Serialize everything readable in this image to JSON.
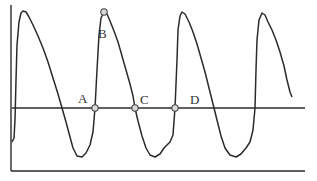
{
  "diagram": {
    "type": "waveform",
    "colors": {
      "stroke": "#2b2b2b",
      "point_fill": "#d8d8d8",
      "point_stroke": "#444444",
      "label": "#333333",
      "background": "#ffffff"
    },
    "axes": {
      "vertical": {
        "x": 11,
        "y1": 5,
        "y2": 171
      },
      "horizontal": {
        "y": 171,
        "x1": 11,
        "x2": 305
      }
    },
    "reference_line": {
      "y": 108,
      "x1": 12,
      "x2": 305
    },
    "curve_points": [
      [
        12,
        142
      ],
      [
        14,
        138
      ],
      [
        15,
        120
      ],
      [
        16,
        80
      ],
      [
        17,
        45
      ],
      [
        19,
        22
      ],
      [
        21,
        13
      ],
      [
        23,
        11
      ],
      [
        26,
        12
      ],
      [
        29,
        17
      ],
      [
        33,
        25
      ],
      [
        38,
        36
      ],
      [
        43,
        48
      ],
      [
        48,
        62
      ],
      [
        53,
        78
      ],
      [
        58,
        94
      ],
      [
        62,
        108
      ],
      [
        66,
        122
      ],
      [
        70,
        137
      ],
      [
        73,
        148
      ],
      [
        77,
        156
      ],
      [
        82,
        157
      ],
      [
        86,
        153
      ],
      [
        90,
        145
      ],
      [
        93,
        132
      ],
      [
        95,
        108
      ],
      [
        97,
        70
      ],
      [
        99,
        35
      ],
      [
        101,
        18
      ],
      [
        104,
        12
      ],
      [
        107,
        14
      ],
      [
        110,
        21
      ],
      [
        114,
        31
      ],
      [
        118,
        42
      ],
      [
        122,
        56
      ],
      [
        126,
        70
      ],
      [
        130,
        84
      ],
      [
        133,
        96
      ],
      [
        135,
        108
      ],
      [
        138,
        121
      ],
      [
        142,
        136
      ],
      [
        146,
        148
      ],
      [
        150,
        155
      ],
      [
        155,
        157
      ],
      [
        160,
        154
      ],
      [
        164,
        148
      ],
      [
        170,
        142
      ],
      [
        173,
        135
      ],
      [
        175,
        108
      ],
      [
        177,
        60
      ],
      [
        178,
        30
      ],
      [
        180,
        16
      ],
      [
        182,
        12
      ],
      [
        185,
        14
      ],
      [
        189,
        22
      ],
      [
        193,
        32
      ],
      [
        197,
        44
      ],
      [
        201,
        58
      ],
      [
        205,
        72
      ],
      [
        209,
        88
      ],
      [
        213,
        104
      ],
      [
        217,
        120
      ],
      [
        221,
        136
      ],
      [
        225,
        148
      ],
      [
        230,
        155
      ],
      [
        236,
        157
      ],
      [
        241,
        154
      ],
      [
        246,
        148
      ],
      [
        250,
        142
      ],
      [
        253,
        130
      ],
      [
        255,
        108
      ],
      [
        256,
        70
      ],
      [
        257,
        40
      ],
      [
        259,
        20
      ],
      [
        262,
        13
      ],
      [
        265,
        15
      ],
      [
        268,
        22
      ],
      [
        272,
        30
      ],
      [
        276,
        40
      ],
      [
        280,
        52
      ],
      [
        284,
        66
      ],
      [
        287,
        80
      ],
      [
        290,
        92
      ],
      [
        292,
        97
      ]
    ],
    "points": [
      {
        "label": "A",
        "x": 95,
        "y": 108,
        "label_x": 78,
        "label_y": 92
      },
      {
        "label": "B",
        "x": 104,
        "y": 12,
        "label_x": 98,
        "label_y": 27
      },
      {
        "label": "C",
        "x": 135,
        "y": 108,
        "label_x": 140,
        "label_y": 93
      },
      {
        "label": "D",
        "x": 175,
        "y": 108,
        "label_x": 190,
        "label_y": 93
      }
    ]
  }
}
